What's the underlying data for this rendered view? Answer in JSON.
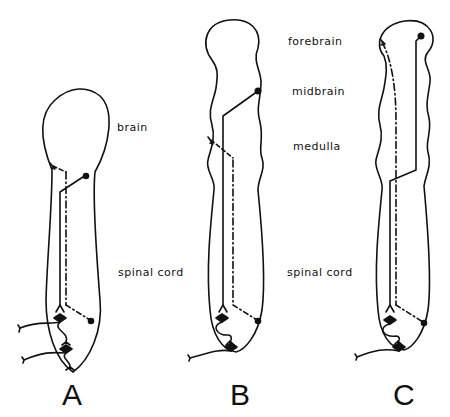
{
  "figure": {
    "panels": [
      {
        "id": "A",
        "letter": "A",
        "labels": {
          "brain": "brain",
          "spinal_cord": "spinal cord"
        }
      },
      {
        "id": "B",
        "letter": "B",
        "labels": {
          "forebrain": "forebrain",
          "midbrain": "midbrain",
          "medulla": "medulla",
          "spinal_cord": "spinal cord"
        }
      },
      {
        "id": "C",
        "letter": "C"
      }
    ],
    "colors": {
      "stroke": "#111111",
      "background": "#ffffff"
    }
  }
}
